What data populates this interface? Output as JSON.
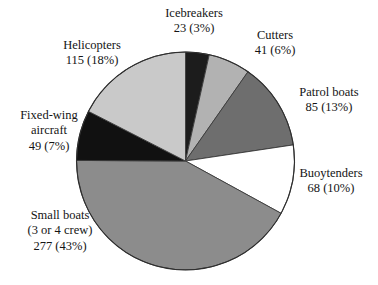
{
  "chart_data": {
    "type": "pie",
    "title": "",
    "subtitle": "",
    "xlabel": "",
    "ylabel": "",
    "grid": false,
    "legend_position": "none",
    "label_format": "value (percent)",
    "total": 658,
    "start_angle_deg": 0,
    "direction": "clockwise",
    "categories": [
      "Icebreakers",
      "Cutters",
      "Patrol boats",
      "Buoytenders",
      "Small boats (3 or 4 crew)",
      "Fixed-wing aircraft",
      "Helicopters"
    ],
    "values": [
      23,
      41,
      85,
      68,
      277,
      49,
      115
    ],
    "percents": [
      3,
      6,
      13,
      10,
      43,
      7,
      18
    ],
    "colors": [
      "#1c1c1c",
      "#b2b2b2",
      "#6e6e6e",
      "#ffffff",
      "#8c8c8c",
      "#111111",
      "#c9c9c9"
    ],
    "slices": [
      {
        "name": "Icebreakers",
        "value": 23,
        "percent": 3,
        "color": "#1c1c1c",
        "start_deg": 0,
        "sweep_deg": 12.6,
        "label": {
          "line1": "Icebreakers",
          "line2": "23 (3%)"
        }
      },
      {
        "name": "Cutters",
        "value": 41,
        "percent": 6,
        "color": "#b2b2b2",
        "start_deg": 12.6,
        "sweep_deg": 22.4,
        "label": {
          "line1": "Cutters",
          "line2": "41 (6%)"
        }
      },
      {
        "name": "Patrol boats",
        "value": 85,
        "percent": 13,
        "color": "#6e6e6e",
        "start_deg": 35.0,
        "sweep_deg": 46.5,
        "label": {
          "line1": "Patrol boats",
          "line2": "85 (13%)"
        }
      },
      {
        "name": "Buoytenders",
        "value": 68,
        "percent": 10,
        "color": "#ffffff",
        "start_deg": 81.5,
        "sweep_deg": 37.2,
        "label": {
          "line1": "Buoytenders",
          "line2": "68 (10%)"
        }
      },
      {
        "name": "Small boats (3 or 4 crew)",
        "value": 277,
        "percent": 43,
        "color": "#8c8c8c",
        "start_deg": 118.7,
        "sweep_deg": 151.6,
        "label": {
          "line1": "Small boats",
          "line2": "(3 or 4 crew)",
          "line3": "277 (43%)"
        }
      },
      {
        "name": "Fixed-wing aircraft",
        "value": 49,
        "percent": 7,
        "color": "#111111",
        "start_deg": 270.3,
        "sweep_deg": 26.8,
        "label": {
          "line1": "Fixed-wing",
          "line2": "aircraft",
          "line3": "49 (7%)"
        }
      },
      {
        "name": "Helicopters",
        "value": 115,
        "percent": 18,
        "color": "#c9c9c9",
        "start_deg": 297.1,
        "sweep_deg": 62.9,
        "label": {
          "line1": "Helicopters",
          "line2": "115 (18%)"
        }
      }
    ]
  }
}
